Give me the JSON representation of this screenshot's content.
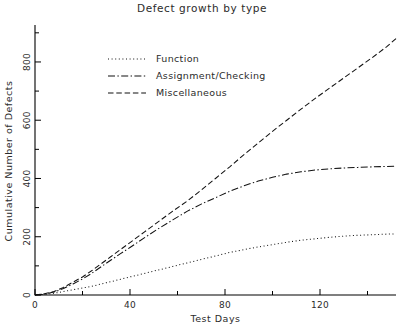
{
  "chart_data": {
    "type": "line",
    "title": "Defect growth by type",
    "xlabel": "Test Days",
    "ylabel": "Cumulative Number of Defects",
    "xlim": [
      0,
      152
    ],
    "ylim": [
      0,
      920
    ],
    "grid": false,
    "legend_position": "upper-left-inside",
    "x_ticks_major": [
      0,
      40,
      80,
      120
    ],
    "x_ticks_minor": [
      20,
      60,
      100,
      140
    ],
    "x_tick_labels": [
      "0",
      "40",
      "80",
      "120"
    ],
    "y_ticks_major": [
      0,
      200,
      400,
      600,
      800
    ],
    "y_ticks_minor": [
      100,
      300,
      500,
      700,
      900
    ],
    "y_tick_labels": [
      "0",
      "200",
      "400",
      "600",
      "800"
    ],
    "series": [
      {
        "name": "Function",
        "style": "dotted",
        "dash": "1,2.6",
        "x": [
          0,
          4,
          8,
          12,
          16,
          20,
          24,
          28,
          32,
          36,
          40,
          46,
          52,
          58,
          64,
          70,
          76,
          82,
          88,
          94,
          100,
          106,
          112,
          118,
          124,
          130,
          136,
          142,
          148,
          152
        ],
        "y": [
          0,
          2,
          6,
          12,
          18,
          24,
          30,
          38,
          46,
          54,
          62,
          74,
          86,
          98,
          110,
          122,
          134,
          146,
          156,
          165,
          173,
          181,
          188,
          193,
          198,
          202,
          205,
          207,
          209,
          210
        ]
      },
      {
        "name": "Assignment/Checking",
        "style": "dash-dot",
        "dash": "7,2.4,1.4,2.4",
        "x": [
          0,
          4,
          8,
          12,
          16,
          20,
          24,
          28,
          32,
          36,
          40,
          46,
          52,
          58,
          64,
          70,
          76,
          82,
          88,
          94,
          100,
          106,
          112,
          118,
          124,
          130,
          136,
          142,
          148,
          152
        ],
        "y": [
          0,
          3,
          10,
          22,
          38,
          55,
          75,
          98,
          120,
          142,
          163,
          196,
          228,
          258,
          287,
          312,
          334,
          356,
          375,
          391,
          404,
          415,
          423,
          429,
          433,
          436,
          438,
          440,
          441,
          442
        ]
      },
      {
        "name": "Miscellaneous",
        "style": "dashed",
        "dash": "5.5,2.8",
        "x": [
          0,
          4,
          8,
          12,
          16,
          20,
          24,
          28,
          32,
          36,
          40,
          46,
          52,
          58,
          64,
          70,
          76,
          82,
          88,
          94,
          100,
          106,
          112,
          118,
          124,
          130,
          136,
          142,
          148,
          152
        ],
        "y": [
          0,
          4,
          12,
          26,
          44,
          62,
          84,
          108,
          132,
          156,
          180,
          216,
          252,
          288,
          322,
          360,
          400,
          440,
          482,
          522,
          562,
          600,
          638,
          675,
          710,
          745,
          780,
          815,
          852,
          880
        ]
      }
    ]
  },
  "legend": {
    "entries": [
      {
        "label": "Function"
      },
      {
        "label": "Assignment/Checking"
      },
      {
        "label": "Miscellaneous"
      }
    ]
  }
}
